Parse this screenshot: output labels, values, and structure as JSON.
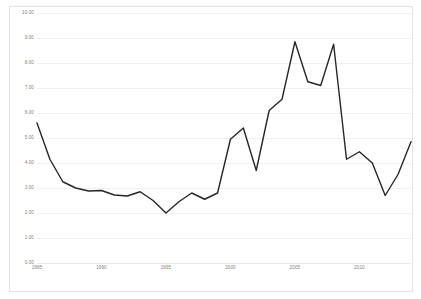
{
  "chart_data": {
    "type": "line",
    "title": "",
    "subtitle": "",
    "xlabel": "",
    "ylabel": "",
    "xlim": [
      1985,
      2014
    ],
    "ylim": [
      0,
      10
    ],
    "ytick_step": 1,
    "ytick_labels": [
      "10.00",
      "9.00",
      "8.00",
      "7.00",
      "6.00",
      "5.00",
      "4.00",
      "3.00",
      "2.00",
      "1.00",
      "0.00"
    ],
    "ytick_values": [
      10,
      9,
      8,
      7,
      6,
      5,
      4,
      3,
      2,
      1,
      0
    ],
    "xtick_labels": [
      "1985",
      "1990",
      "1995",
      "2000",
      "2005",
      "2010"
    ],
    "xtick_values": [
      1985,
      1990,
      1995,
      2000,
      2005,
      2010
    ],
    "grid": "horizontal",
    "legend": "none",
    "line_color": "#262626",
    "grid_color": "#f0f0f0",
    "axis_label_color": "#808080",
    "background_color": "#ffffff",
    "border_color": "#e3e3e3",
    "x": [
      1985,
      1986,
      1987,
      1988,
      1989,
      1990,
      1991,
      1992,
      1993,
      1994,
      1995,
      1996,
      1997,
      1998,
      1999,
      2000,
      2001,
      2002,
      2003,
      2004,
      2005,
      2006,
      2007,
      2008,
      2009,
      2010,
      2011,
      2012,
      2013,
      2014
    ],
    "series": [
      {
        "name": "series-1",
        "values": [
          5.6,
          4.15,
          3.25,
          3.0,
          2.88,
          2.9,
          2.72,
          2.68,
          2.85,
          2.5,
          2.0,
          2.45,
          2.8,
          2.55,
          2.8,
          4.95,
          5.4,
          3.7,
          6.1,
          6.55,
          8.85,
          7.25,
          7.1,
          8.75,
          4.15,
          4.45,
          4.0,
          2.7,
          3.55,
          4.85
        ]
      }
    ]
  }
}
